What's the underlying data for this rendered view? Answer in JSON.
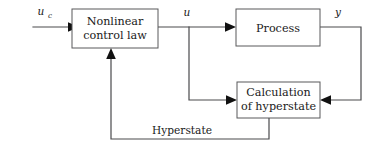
{
  "diagram": {
    "colors": {
      "background": "#ffffff",
      "box_stroke": "#58585a",
      "wire": "#4a4a4c",
      "arrow": "#111111",
      "text": "#1a1a1a"
    },
    "blocks": [
      {
        "id": "nonlinear-control-law",
        "line1": "Nonlinear",
        "line2": "control law"
      },
      {
        "id": "process",
        "line1": "Process",
        "line2": ""
      },
      {
        "id": "calculation-of-hyperstate",
        "line1": "Calculation",
        "line2": "of hyperstate"
      }
    ],
    "signals": {
      "command_input": "u",
      "command_input_subscript": "c",
      "control_output": "u",
      "process_output": "y",
      "feedback_path": "Hyperstate"
    }
  }
}
